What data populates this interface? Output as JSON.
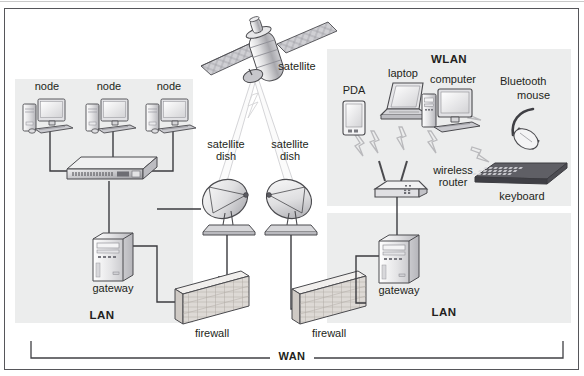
{
  "diagram": {
    "frame": {
      "border_color": "#56565a",
      "background": "#ffffff"
    },
    "panel_fill": "#eceded",
    "wire_color": "#3b3b3f",
    "wireless_color": "#b9b9bc"
  },
  "zones": {
    "lan_left": {
      "label": "LAN",
      "x": 14,
      "y": 78,
      "w": 178,
      "h": 244
    },
    "lan_right": {
      "label": "LAN",
      "x": 326,
      "y": 212,
      "w": 244,
      "h": 110
    },
    "wlan": {
      "label": "WLAN",
      "x": 326,
      "y": 48,
      "w": 244,
      "h": 157
    }
  },
  "nodes": {
    "satellite": {
      "label": "satellite"
    },
    "dish_left": {
      "label": "satellite\ndish",
      "line1": "satellite",
      "line2": "dish"
    },
    "dish_right": {
      "label": "satellite\ndish",
      "line1": "satellite",
      "line2": "dish"
    },
    "node_1": {
      "label": "node"
    },
    "node_2": {
      "label": "node"
    },
    "node_3": {
      "label": "node"
    },
    "switch": {
      "label": ""
    },
    "gateway_left": {
      "label": "gateway"
    },
    "gateway_right": {
      "label": "gateway"
    },
    "firewall_left": {
      "label": "firewall"
    },
    "firewall_right": {
      "label": "firewall"
    },
    "pda": {
      "label": "PDA"
    },
    "laptop": {
      "label": "laptop"
    },
    "computer": {
      "label": "computer"
    },
    "bluetooth_mouse": {
      "line1": "Bluetooth",
      "line2": "mouse"
    },
    "keyboard": {
      "label": "keyboard"
    },
    "wireless_router": {
      "line1": "wireless",
      "line2": "router"
    }
  },
  "wan": {
    "label": "WAN"
  }
}
